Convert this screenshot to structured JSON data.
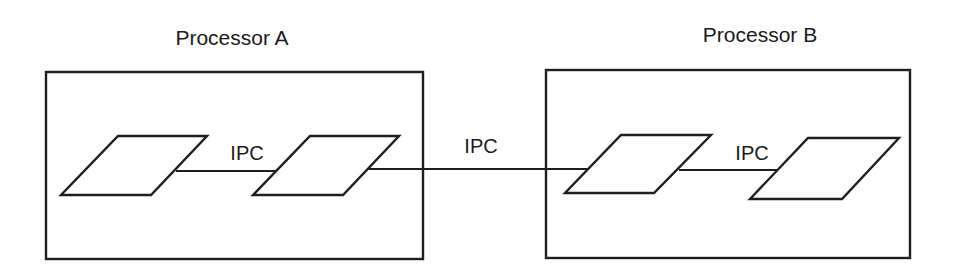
{
  "diagram": {
    "colors": {
      "background": "#ffffff",
      "stroke": "#1e1e1e",
      "text": "#1a1a1a"
    },
    "processors": [
      {
        "id": "A",
        "label": "Processor A",
        "processes": 2
      },
      {
        "id": "B",
        "label": "Processor B",
        "processes": 2
      }
    ],
    "links": [
      {
        "from": "A.process1",
        "to": "A.process2",
        "label": "IPC",
        "scope": "intra-processor"
      },
      {
        "from": "A.process2",
        "to": "B.process1",
        "label": "IPC",
        "scope": "inter-processor"
      },
      {
        "from": "B.process1",
        "to": "B.process2",
        "label": "IPC",
        "scope": "intra-processor"
      }
    ]
  }
}
